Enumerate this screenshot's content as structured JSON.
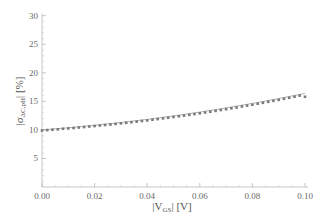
{
  "chart_data": {
    "type": "line",
    "title": "",
    "xlabel": "|V_GS| [V]",
    "ylabel": "|σ_ΔC,pH| [%]",
    "xlim": [
      0,
      0.1
    ],
    "ylim": [
      0,
      30
    ],
    "x_ticks": [
      "0.00",
      "0.02",
      "0.04",
      "0.06",
      "0.08",
      "0.10"
    ],
    "y_ticks": [
      "5",
      "10",
      "15",
      "20",
      "25",
      "30"
    ],
    "grid": false,
    "legend": null,
    "series": [
      {
        "name": "model (solid line)",
        "style": "line",
        "color": "#a8a8a8",
        "x": [
          0,
          0.01,
          0.02,
          0.03,
          0.04,
          0.05,
          0.06,
          0.07,
          0.08,
          0.09,
          0.1
        ],
        "values": [
          10.0,
          10.37,
          10.8,
          11.29,
          11.84,
          12.45,
          13.12,
          13.85,
          14.64,
          15.49,
          16.4
        ]
      },
      {
        "name": "simulation (points)",
        "style": "markers",
        "color": "#7a7a7a",
        "x": [
          0,
          0.002,
          0.004,
          0.006,
          0.008,
          0.01,
          0.012,
          0.014,
          0.016,
          0.018,
          0.02,
          0.022,
          0.024,
          0.026,
          0.028,
          0.03,
          0.032,
          0.034,
          0.036,
          0.038,
          0.04,
          0.042,
          0.044,
          0.046,
          0.048,
          0.05,
          0.052,
          0.054,
          0.056,
          0.058,
          0.06,
          0.062,
          0.064,
          0.066,
          0.068,
          0.07,
          0.072,
          0.074,
          0.076,
          0.078,
          0.08,
          0.082,
          0.084,
          0.086,
          0.088,
          0.09,
          0.092,
          0.094,
          0.096,
          0.098,
          0.1
        ],
        "values": [
          9.9,
          9.97,
          10.04,
          10.11,
          10.19,
          10.26,
          10.34,
          10.42,
          10.5,
          10.59,
          10.68,
          10.77,
          10.86,
          10.95,
          11.05,
          11.14,
          11.24,
          11.35,
          11.45,
          11.56,
          11.67,
          11.78,
          11.9,
          12.01,
          12.13,
          12.26,
          12.38,
          12.51,
          12.64,
          12.77,
          12.91,
          13.05,
          13.19,
          13.33,
          13.48,
          13.63,
          13.78,
          13.93,
          14.09,
          14.25,
          14.41,
          14.58,
          14.75,
          14.92,
          15.09,
          15.27,
          15.45,
          15.63,
          15.82,
          16.01,
          15.8
        ]
      }
    ]
  },
  "axes": {
    "x_label_main": "|V",
    "x_label_sub": "GS",
    "x_label_tail": "| [V]",
    "y_label_main": "|σ",
    "y_label_sub": "ΔC,pH",
    "y_label_tail": "| [%]"
  }
}
